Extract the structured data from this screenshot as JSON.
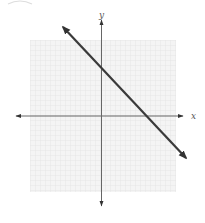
{
  "diagram": {
    "type": "coordinate-plane-line-graph",
    "axes": {
      "x_label": "x",
      "y_label": "y",
      "arrows": true
    },
    "grid": {
      "visible": true,
      "color": "#e6e6e6",
      "background": "#f2f2f2"
    },
    "line": {
      "color": "#3a3a3a",
      "slope_sign": "negative",
      "direction": "upper-left to lower-right",
      "arrows_both_ends": true
    },
    "colors": {
      "axis": "#555555",
      "line": "#3a3a3a",
      "grid": "#e6e6e6"
    },
    "corner_mark": "partial-circle-arc"
  }
}
